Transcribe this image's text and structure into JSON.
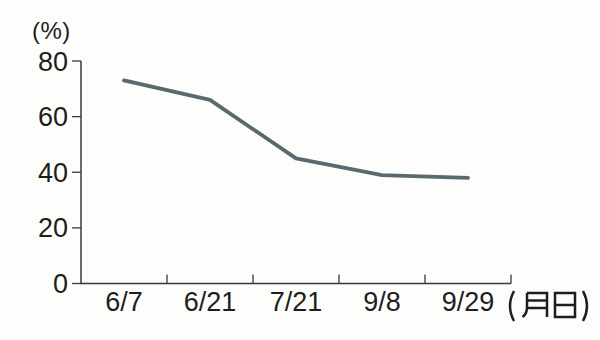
{
  "chart_data": {
    "type": "line",
    "title": "",
    "categories": [
      "6/7",
      "6/21",
      "7/21",
      "9/8",
      "9/29"
    ],
    "values": [
      73,
      66,
      45,
      39,
      38
    ],
    "xlabel": "(月日)",
    "ylabel": "(%)",
    "yticks": [
      0,
      20,
      40,
      60,
      80
    ],
    "ylim": [
      0,
      80
    ],
    "grid": false,
    "legend": "none",
    "colors": {
      "line": "#586a6e",
      "axis": "#3a3a3a",
      "text": "#1e1e1e",
      "background": "#fdfdfb"
    }
  }
}
